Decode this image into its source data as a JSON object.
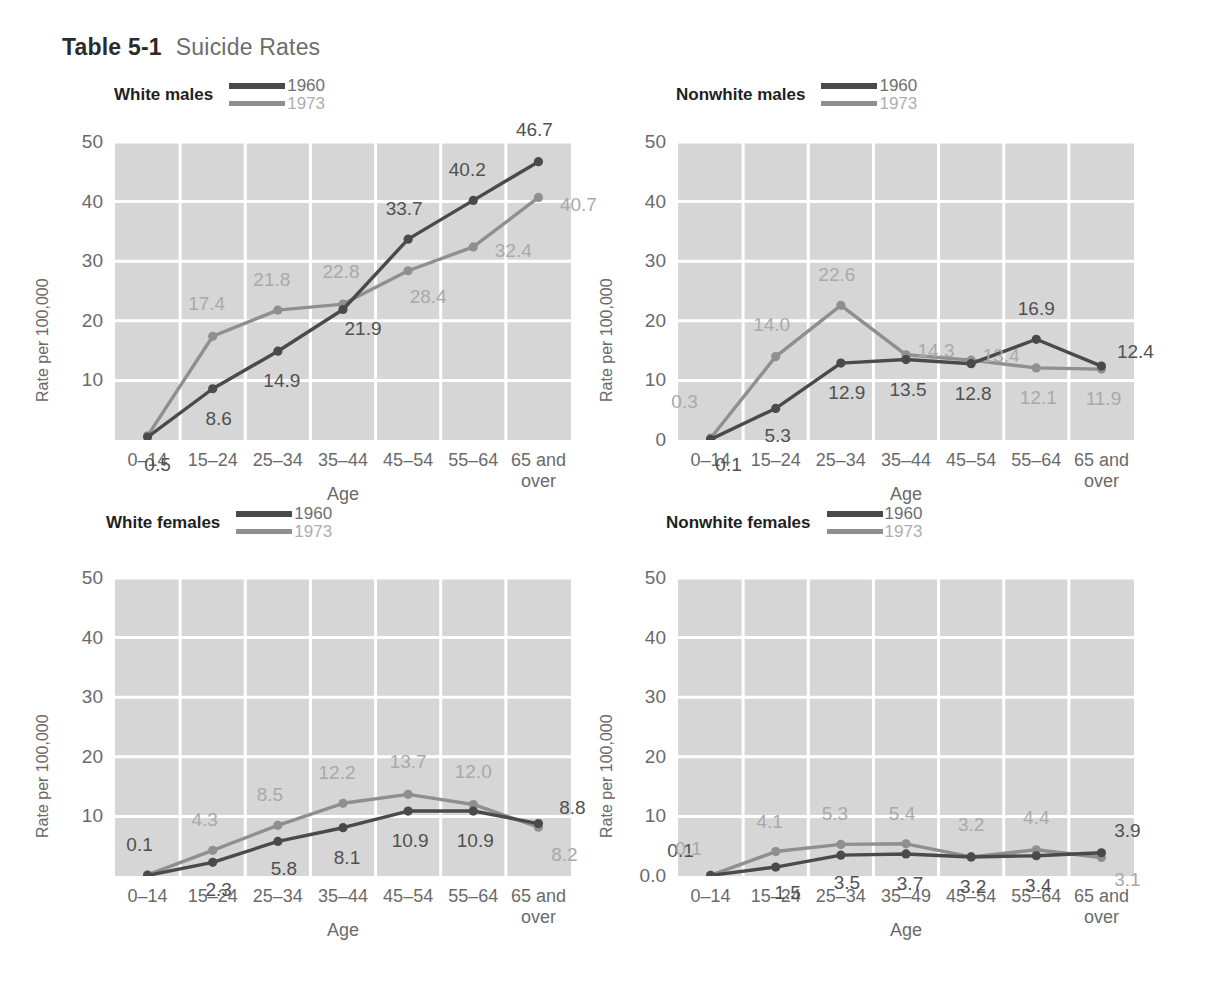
{
  "figure": {
    "label": "Table 5-1",
    "title": "Suicide Rates"
  },
  "legend": {
    "series_1_label": "1960",
    "series_2_label": "1973",
    "series_1_color": "#4a4a4a",
    "series_2_color": "#8f8f8f"
  },
  "axes": {
    "ylabel": "Rate per 100,000",
    "xlabel": "Age"
  },
  "chart_data": [
    {
      "type": "line",
      "title": "White males",
      "xlabel": "Age",
      "ylabel": "Rate per 100,000",
      "ylim": [
        0,
        50
      ],
      "yticks": [
        "10",
        "20",
        "30",
        "40",
        "50"
      ],
      "ytick_values": [
        10,
        20,
        30,
        40,
        50
      ],
      "baseline_label": "0.7",
      "grid": true,
      "legend_position": "top-right",
      "categories": [
        "0–14",
        "15–24",
        "25–34",
        "35–44",
        "45–54",
        "55–64",
        "65 and over"
      ],
      "series": [
        {
          "name": "1960",
          "color": "#4a4a4a",
          "values": [
            0.5,
            8.6,
            14.9,
            21.9,
            33.7,
            40.2,
            46.7
          ],
          "labels": [
            "0.5",
            "8.6",
            "14.9",
            "21.9",
            "33.7",
            "40.2",
            "46.7"
          ]
        },
        {
          "name": "1973",
          "color": "#8f8f8f",
          "values": [
            0.7,
            17.4,
            21.8,
            22.8,
            28.4,
            32.4,
            40.7
          ],
          "labels": [
            "0.7",
            "17.4",
            "21.8",
            "22.8",
            "28.4",
            "32.4",
            "40.7"
          ]
        }
      ]
    },
    {
      "type": "line",
      "title": "Nonwhite males",
      "xlabel": "Age",
      "ylabel": "Rate per 100,000",
      "ylim": [
        0,
        50
      ],
      "yticks": [
        "0",
        "10",
        "20",
        "30",
        "40",
        "50"
      ],
      "ytick_values": [
        0,
        10,
        20,
        30,
        40,
        50
      ],
      "baseline_label": "0",
      "grid": true,
      "legend_position": "top-right",
      "categories": [
        "0–14",
        "15–24",
        "25–34",
        "35–44",
        "45–54",
        "55–64",
        "65 and over"
      ],
      "series": [
        {
          "name": "1960",
          "color": "#4a4a4a",
          "values": [
            0.1,
            5.3,
            12.9,
            13.5,
            12.8,
            16.9,
            12.4
          ],
          "labels": [
            "0.1",
            "5.3",
            "12.9",
            "13.5",
            "12.8",
            "16.9",
            "12.4"
          ]
        },
        {
          "name": "1973",
          "color": "#8f8f8f",
          "values": [
            0.3,
            14.0,
            22.6,
            14.3,
            13.4,
            12.1,
            11.9
          ],
          "labels": [
            "0.3",
            "14.0",
            "22.6",
            "14.3",
            "13.4",
            "12.1",
            "11.9"
          ]
        }
      ]
    },
    {
      "type": "line",
      "title": "White females",
      "xlabel": "Age",
      "ylabel": "Rate per 100,000",
      "ylim": [
        0,
        50
      ],
      "yticks": [
        "10",
        "20",
        "30",
        "40",
        "50"
      ],
      "ytick_values": [
        10,
        20,
        30,
        40,
        50
      ],
      "baseline_label": "0.2",
      "grid": true,
      "legend_position": "top-right",
      "categories": [
        "0–14",
        "15–24",
        "25–34",
        "35–44",
        "45–54",
        "55–64",
        "65 and over"
      ],
      "series": [
        {
          "name": "1960",
          "color": "#4a4a4a",
          "values": [
            0.1,
            2.3,
            5.8,
            8.1,
            10.9,
            10.9,
            8.8
          ],
          "labels": [
            "0.1",
            "2.3",
            "5.8",
            "8.1",
            "10.9",
            "10.9",
            "8.8"
          ]
        },
        {
          "name": "1973",
          "color": "#8f8f8f",
          "values": [
            0.2,
            4.3,
            8.5,
            12.2,
            13.7,
            12.0,
            8.2
          ],
          "labels": [
            "0.2",
            "4.3",
            "8.5",
            "12.2",
            "13.7",
            "12.0",
            "8.2"
          ]
        }
      ]
    },
    {
      "type": "line",
      "title": "Nonwhite females",
      "xlabel": "Age",
      "ylabel": "Rate per 100,000",
      "ylim": [
        0,
        50
      ],
      "yticks": [
        "0.0",
        "10",
        "20",
        "30",
        "40",
        "50"
      ],
      "ytick_values": [
        0,
        10,
        20,
        30,
        40,
        50
      ],
      "baseline_label": "0.0",
      "grid": true,
      "legend_position": "top-right",
      "categories": [
        "0–14",
        "15–24",
        "25–34",
        "35–49",
        "45–54",
        "55–64",
        "65 and over"
      ],
      "series": [
        {
          "name": "1960",
          "color": "#4a4a4a",
          "values": [
            0.1,
            1.5,
            3.5,
            3.7,
            3.2,
            3.4,
            3.9
          ],
          "labels": [
            "0.1",
            "1.5",
            "3.5",
            "3.7",
            "3.2",
            "3.4",
            "3.9"
          ]
        },
        {
          "name": "1973",
          "color": "#8f8f8f",
          "values": [
            0.1,
            4.1,
            5.3,
            5.4,
            3.2,
            4.4,
            3.1
          ],
          "labels": [
            "0.1",
            "4.1",
            "5.3",
            "5.4",
            "3.2",
            "4.4",
            "3.1"
          ]
        }
      ]
    }
  ],
  "label_offsets": [
    {
      "s1960": [
        [
          10,
          28
        ],
        [
          6,
          30
        ],
        [
          4,
          30
        ],
        [
          20,
          20
        ],
        [
          -4,
          -30
        ],
        [
          -6,
          -30
        ],
        [
          -4,
          -32
        ]
      ],
      "s1973": [
        [
          -26,
          -6
        ],
        [
          -6,
          -32
        ],
        [
          -6,
          -30
        ],
        [
          -2,
          -32
        ],
        [
          20,
          26
        ],
        [
          40,
          4
        ],
        [
          40,
          8
        ]
      ]
    },
    {
      "s1960": [
        [
          18,
          26
        ],
        [
          2,
          28
        ],
        [
          6,
          30
        ],
        [
          2,
          30
        ],
        [
          2,
          30
        ],
        [
          0,
          -30
        ],
        [
          34,
          -14
        ]
      ],
      "s1973": [
        [
          -26,
          -36
        ],
        [
          -4,
          -32
        ],
        [
          -4,
          -30
        ],
        [
          30,
          -4
        ],
        [
          30,
          -4
        ],
        [
          2,
          30
        ],
        [
          2,
          30
        ]
      ]
    },
    {
      "s1960": [
        [
          -8,
          -30
        ],
        [
          6,
          28
        ],
        [
          6,
          28
        ],
        [
          4,
          30
        ],
        [
          2,
          30
        ],
        [
          2,
          30
        ],
        [
          34,
          -16
        ]
      ],
      "s1973": [
        [
          -26,
          -6
        ],
        [
          -8,
          -30
        ],
        [
          -8,
          -30
        ],
        [
          -6,
          -30
        ],
        [
          0,
          -32
        ],
        [
          0,
          -32
        ],
        [
          26,
          28
        ]
      ]
    },
    {
      "s1960": [
        [
          -30,
          -24
        ],
        [
          12,
          26
        ],
        [
          6,
          28
        ],
        [
          4,
          30
        ],
        [
          2,
          30
        ],
        [
          2,
          30
        ],
        [
          26,
          -22
        ]
      ],
      "s1973": [
        [
          -22,
          -26
        ],
        [
          -6,
          -30
        ],
        [
          -6,
          -30
        ],
        [
          -4,
          -30
        ],
        [
          0,
          -32
        ],
        [
          0,
          -32
        ],
        [
          26,
          22
        ]
      ]
    }
  ]
}
